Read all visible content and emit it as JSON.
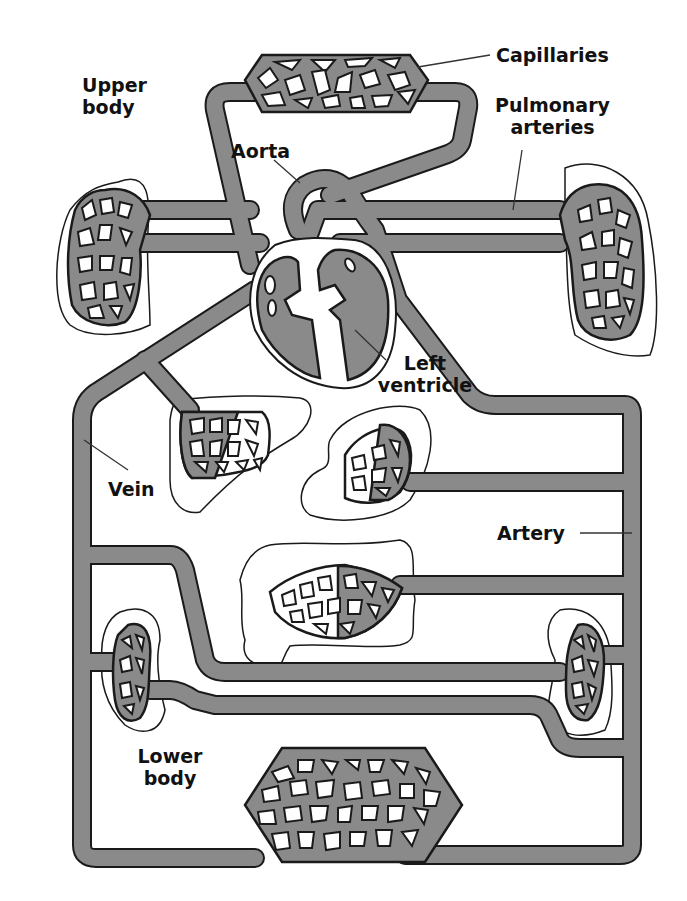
{
  "diagram": {
    "colors": {
      "vessel_fill": "#8a8a8a",
      "vessel_outline": "#1a1a1a",
      "background": "#ffffff",
      "text": "#111111"
    },
    "labels": {
      "capillaries": "Capillaries",
      "upper_body_line1": "Upper",
      "upper_body_line2": "body",
      "pulmonary_line1": "Pulmonary",
      "pulmonary_line2": "arteries",
      "aorta": "Aorta",
      "left_ventricle_line1": "Left",
      "left_ventricle_line2": "ventricle",
      "vein": "Vein",
      "artery": "Artery",
      "lower_body_line1": "Lower",
      "lower_body_line2": "body"
    },
    "parts": [
      "upper-body-capillaries",
      "left-lung",
      "right-lung",
      "heart",
      "aorta",
      "pulmonary-arteries",
      "liver",
      "stomach",
      "intestine",
      "left-kidney",
      "right-kidney",
      "lower-body-capillaries",
      "main-vein",
      "main-artery"
    ]
  }
}
